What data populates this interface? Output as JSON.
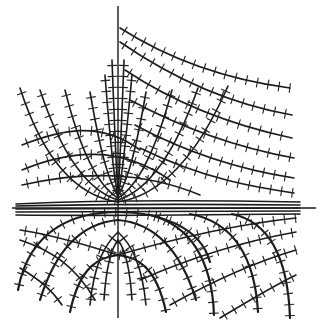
{
  "figure": {
    "width": 325,
    "height": 332,
    "background": "#ffffff",
    "ink_color": "#1c1c1c"
  },
  "axes": {
    "origin": [
      118,
      208
    ],
    "horizontal": {
      "x1": 12,
      "x2": 316,
      "y": 208
    },
    "vertical": {
      "x": 118,
      "y1": 6,
      "y2": 318
    }
  },
  "curve_families": {
    "upper_u_curves": [
      "M20,88 C40,150 70,195 118,202",
      "M40,90 C60,150 85,190 118,200",
      "M65,90 C80,150 98,186 118,198",
      "M90,92 C100,150 108,180 118,196",
      "M105,75 C110,140 114,180 118,195",
      "M112,60 C115,140 117,180 118,194",
      "M124,60 C121,140 119,180 118,194",
      "M132,75 C126,140 122,180 118,195",
      "M146,92 C136,150 128,180 118,196",
      "M172,90 C156,150 138,186 118,198",
      "M198,88 C176,150 150,190 118,200",
      "M228,86 C200,150 165,195 118,202"
    ],
    "right_hyperbolas": [
      "M120,28 C170,60 230,80 290,88",
      "M120,42 C175,80 235,105 292,115",
      "M125,70 C185,110 245,128 292,138",
      "M130,100 C195,135 250,150 294,158",
      "M135,125 C200,160 255,172 294,178",
      "M140,148 C205,180 260,188 294,193"
    ],
    "left_arcs": [
      "M22,145 C60,130 100,120 140,150",
      "M22,170 C70,150 120,145 170,180",
      "M22,185 C80,172 140,170 200,195"
    ],
    "center_band": [
      "M16,204 C100,200 200,200 300,202",
      "M16,206 C100,204 200,204 300,205",
      "M16,209 C100,208 200,208 300,208",
      "M16,212 C100,212 200,212 300,211",
      "M16,215 C100,216 200,215 300,214"
    ],
    "lower_arches": [
      "M70,312 C80,265 100,257 118,255 C136,257 156,265 166,312",
      "M40,300 C60,235 95,222 118,220 C141,222 176,235 196,300",
      "M18,290 C30,225 80,212 118,212 C156,212 200,225 210,262",
      "M150,215 C190,225 212,260 214,315",
      "M190,214 C235,222 255,260 258,312",
      "M232,214 C270,222 288,260 290,318"
    ],
    "lower_inner": [
      "M104,300 C106,270 110,250 118,240",
      "M132,300 C130,270 126,250 118,240",
      "M90,305 C94,265 104,245 118,232",
      "M146,305 C142,265 132,245 118,232"
    ],
    "lower_right_sweeps": [
      "M118,255 C170,240 230,225 296,218",
      "M140,280 C190,258 240,242 296,232",
      "M170,305 C215,280 255,262 296,250",
      "M220,318 C250,300 275,285 296,275"
    ],
    "lower_left_sweeps": [
      "M20,240 C50,250 75,265 95,300",
      "M20,268 C40,280 52,290 62,305",
      "M20,230 C60,236 95,248 118,255"
    ]
  },
  "tick_marks": {
    "spacing_px": 11,
    "length_px": 9
  }
}
